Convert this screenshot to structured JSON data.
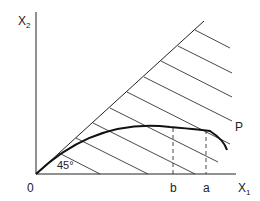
{
  "diagram": {
    "axes": {
      "y_label": "X",
      "y_label_sub": "2",
      "x_label": "X",
      "x_label_sub": "1",
      "origin_label": "0"
    },
    "angle_label": "45°",
    "curve_label": "P",
    "x_markers": [
      {
        "label": "b",
        "x": 173
      },
      {
        "label": "a",
        "x": 206
      }
    ],
    "colors": {
      "line": "#222222",
      "curve": "#111111"
    }
  }
}
